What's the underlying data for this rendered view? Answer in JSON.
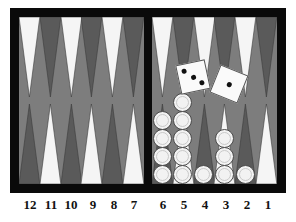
{
  "board": {
    "title": "Backgammon board",
    "colors": {
      "frame": "#0a0a0a",
      "felt": "#7d7d7d",
      "point_light": "#f5f5f5",
      "point_dark": "#5a5a5a",
      "checker_white": "#f2f2f2",
      "page_background": "#ffffff",
      "pip": "#111111"
    },
    "point_labels": [
      "12",
      "11",
      "10",
      "9",
      "8",
      "7",
      "6",
      "5",
      "4",
      "3",
      "2",
      "1"
    ],
    "quadrants": {
      "top_left_colors": [
        "light",
        "dark",
        "light",
        "dark",
        "light",
        "dark"
      ],
      "bottom_left_colors": [
        "dark",
        "light",
        "dark",
        "light",
        "dark",
        "light"
      ],
      "top_right_colors": [
        "light",
        "dark",
        "light",
        "dark",
        "light",
        "dark"
      ],
      "bottom_right_colors": [
        "dark",
        "light",
        "dark",
        "light",
        "dark",
        "light"
      ]
    },
    "checkers": [
      {
        "point": "6",
        "count": 4,
        "color": "white"
      },
      {
        "point": "5",
        "count": 5,
        "color": "white"
      },
      {
        "point": "4",
        "count": 1,
        "color": "white"
      },
      {
        "point": "3",
        "count": 3,
        "color": "white"
      },
      {
        "point": "2",
        "count": 1,
        "color": "white"
      },
      {
        "point": "1",
        "count": 0,
        "color": "white"
      }
    ],
    "total_checkers_visible": 14,
    "dice": [
      {
        "name": "die-left",
        "value": 3,
        "rotation_deg": -12,
        "x": 178,
        "y": 63
      },
      {
        "name": "die-right",
        "value": 1,
        "rotation_deg": 22,
        "x": 215,
        "y": 70
      }
    ]
  }
}
